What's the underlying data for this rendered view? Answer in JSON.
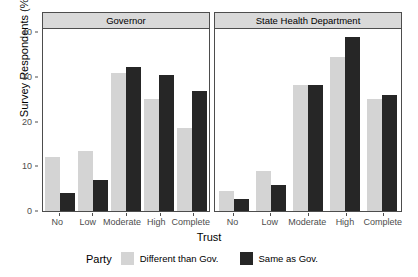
{
  "chart_data": {
    "type": "bar",
    "title": "",
    "xlabel": "Trust",
    "ylabel": "Survey Respondents (%)",
    "ylim": [
      0,
      41
    ],
    "yticks": [
      0,
      10,
      20,
      30,
      40
    ],
    "ytick_labels": [
      "0",
      "10",
      "20",
      "30",
      "40"
    ],
    "categories": [
      "No",
      "Low",
      "Moderate",
      "High",
      "Complete"
    ],
    "grid": false,
    "legend": {
      "title": "Party",
      "position": "bottom",
      "entries": [
        {
          "name": "Different than Gov.",
          "color": "#d4d4d4"
        },
        {
          "name": "Same as Gov.",
          "color": "#262626"
        }
      ]
    },
    "panels": [
      {
        "label": "Governor",
        "series": [
          {
            "name": "Different than Gov.",
            "color": "#d4d4d4",
            "values": [
              12.0,
              13.5,
              31.0,
              25.0,
              18.7
            ]
          },
          {
            "name": "Same as Gov.",
            "color": "#262626",
            "values": [
              4.0,
              7.0,
              32.2,
              30.4,
              27.0
            ]
          }
        ]
      },
      {
        "label": "State Health Department",
        "series": [
          {
            "name": "Different than Gov.",
            "color": "#d4d4d4",
            "values": [
              4.5,
              9.0,
              28.3,
              34.5,
              25.0
            ]
          },
          {
            "name": "Same as Gov.",
            "color": "#262626",
            "values": [
              2.8,
              5.8,
              28.3,
              39.0,
              26.0
            ]
          }
        ]
      }
    ]
  },
  "axes": {
    "y_title": "Survey Respondents (%)",
    "x_title": "Trust"
  }
}
